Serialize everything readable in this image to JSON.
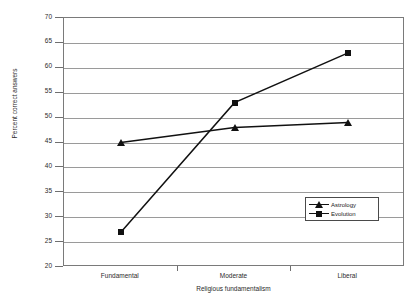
{
  "chart_data": {
    "type": "line",
    "title": "",
    "xlabel": "Religious fundamentalism",
    "ylabel": "Percent correct answers",
    "categories": [
      "Fundamental",
      "Moderate",
      "Liberal"
    ],
    "ylim": [
      20,
      70
    ],
    "yticks": [
      70,
      65,
      60,
      55,
      50,
      45,
      40,
      35,
      30,
      25,
      20
    ],
    "grid": true,
    "legend_position": "inside-bottom-right",
    "series": [
      {
        "name": "Astrology",
        "marker": "triangle",
        "color": "#111111",
        "values": [
          45,
          48,
          49
        ]
      },
      {
        "name": "Evolution",
        "marker": "square",
        "color": "#111111",
        "values": [
          27,
          53,
          63
        ]
      }
    ]
  },
  "legend": {
    "items": [
      {
        "label": "Astrology",
        "marker": "triangle"
      },
      {
        "label": "Evolution",
        "marker": "square"
      }
    ]
  }
}
